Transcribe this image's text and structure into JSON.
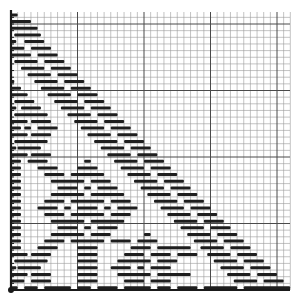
{
  "diagram": {
    "type": "gantt-staircase-on-grid",
    "grid": {
      "origin_px": [
        11,
        290
      ],
      "top_px": 12,
      "right_px": 290,
      "cell_px": 6.65,
      "cols": 42,
      "rows": 42,
      "major_every": 10,
      "minor_color": "#9a9a9a",
      "major_color": "#4a4a4a",
      "axis_color": "#1a1a1a"
    },
    "bar_color": "#1e1e1e",
    "bar_thickness_px": 3,
    "rows": [
      {
        "segments": [
          [
            0,
            1
          ]
        ]
      },
      {
        "segments": [
          [
            0,
            3
          ]
        ]
      },
      {
        "segments": [
          [
            0,
            4
          ]
        ]
      },
      {
        "segments": [
          [
            0.5,
            4.5
          ]
        ]
      },
      {
        "segments": [
          [
            0,
            0.8
          ],
          [
            2,
            5
          ]
        ]
      },
      {
        "segments": [
          [
            0,
            2
          ],
          [
            3,
            6
          ]
        ]
      },
      {
        "segments": [
          [
            0,
            3
          ],
          [
            4,
            7
          ]
        ]
      },
      {
        "segments": [
          [
            0.5,
            4
          ],
          [
            5,
            8
          ]
        ]
      },
      {
        "segments": [
          [
            1.5,
            5
          ],
          [
            6,
            9
          ]
        ]
      },
      {
        "segments": [
          [
            2.5,
            6
          ],
          [
            7,
            10
          ]
        ]
      },
      {
        "segments": [
          [
            0,
            0.5
          ],
          [
            3.5,
            7
          ],
          [
            8,
            11
          ]
        ]
      },
      {
        "segments": [
          [
            0,
            1.5
          ],
          [
            4.5,
            8
          ],
          [
            9,
            12
          ]
        ]
      },
      {
        "segments": [
          [
            0,
            2.5
          ],
          [
            5.5,
            9
          ],
          [
            10,
            13
          ]
        ]
      },
      {
        "segments": [
          [
            0.5,
            3.5
          ],
          [
            6.5,
            10
          ],
          [
            11,
            14
          ]
        ]
      },
      {
        "segments": [
          [
            0,
            0.8
          ],
          [
            1.5,
            4.5
          ],
          [
            7.5,
            11
          ],
          [
            12,
            15
          ]
        ]
      },
      {
        "segments": [
          [
            0.5,
            5.5
          ],
          [
            8.5,
            12
          ],
          [
            13,
            16
          ]
        ]
      },
      {
        "segments": [
          [
            0,
            2.5
          ],
          [
            3,
            6
          ],
          [
            9.5,
            13
          ],
          [
            14,
            17
          ]
        ]
      },
      {
        "segments": [
          [
            0,
            1.5
          ],
          [
            2,
            3
          ],
          [
            4,
            7
          ],
          [
            10.5,
            14
          ],
          [
            15,
            18
          ]
        ]
      },
      {
        "segments": [
          [
            0,
            2.5
          ],
          [
            3,
            6
          ],
          [
            11.5,
            15
          ],
          [
            16,
            19
          ]
        ]
      },
      {
        "segments": [
          [
            0.5,
            5.5
          ],
          [
            12.5,
            16
          ],
          [
            17,
            20
          ]
        ]
      },
      {
        "segments": [
          [
            0,
            0.8
          ],
          [
            1,
            4.5
          ],
          [
            13.5,
            17
          ],
          [
            18,
            21
          ]
        ]
      },
      {
        "segments": [
          [
            0,
            2.5
          ],
          [
            3,
            6
          ],
          [
            14.5,
            18
          ],
          [
            19,
            22
          ]
        ]
      },
      {
        "segments": [
          [
            0,
            1.5
          ],
          [
            2.5,
            5.5
          ],
          [
            11,
            12
          ],
          [
            15.5,
            19
          ],
          [
            20,
            23
          ]
        ]
      },
      {
        "segments": [
          [
            0,
            1.5
          ],
          [
            4,
            7
          ],
          [
            10,
            13
          ],
          [
            16.5,
            20
          ],
          [
            21,
            24
          ]
        ]
      },
      {
        "segments": [
          [
            0,
            1.5
          ],
          [
            5,
            8
          ],
          [
            9,
            14
          ],
          [
            17.5,
            21
          ],
          [
            22,
            25
          ]
        ]
      },
      {
        "segments": [
          [
            0,
            1.5
          ],
          [
            6,
            11
          ],
          [
            12,
            15
          ],
          [
            18.5,
            22
          ],
          [
            23,
            26
          ]
        ]
      },
      {
        "segments": [
          [
            0,
            1.5
          ],
          [
            7,
            10
          ],
          [
            11,
            12
          ],
          [
            13,
            16
          ],
          [
            19.5,
            23
          ],
          [
            24,
            27
          ]
        ]
      },
      {
        "segments": [
          [
            0,
            1.5
          ],
          [
            6,
            11
          ],
          [
            12,
            17
          ],
          [
            20.5,
            24
          ],
          [
            25,
            28
          ]
        ]
      },
      {
        "segments": [
          [
            0,
            1.5
          ],
          [
            5,
            8
          ],
          [
            9,
            14
          ],
          [
            15,
            18
          ],
          [
            21.5,
            25
          ],
          [
            26,
            29
          ]
        ]
      },
      {
        "segments": [
          [
            0,
            1.5
          ],
          [
            4,
            7
          ],
          [
            8,
            9
          ],
          [
            10,
            13
          ],
          [
            14,
            15
          ],
          [
            16,
            19
          ],
          [
            22.5,
            26
          ],
          [
            27,
            30
          ]
        ]
      },
      {
        "segments": [
          [
            0,
            1.5
          ],
          [
            5,
            8
          ],
          [
            9,
            14
          ],
          [
            15,
            18
          ],
          [
            23.5,
            27
          ],
          [
            28,
            31
          ]
        ]
      },
      {
        "segments": [
          [
            0,
            1.5
          ],
          [
            6,
            11
          ],
          [
            12,
            17
          ],
          [
            24.5,
            28
          ],
          [
            29,
            32
          ]
        ]
      },
      {
        "segments": [
          [
            0,
            1.5
          ],
          [
            7,
            10
          ],
          [
            11,
            12
          ],
          [
            13,
            16
          ],
          [
            25.5,
            29
          ],
          [
            30,
            33
          ]
        ]
      },
      {
        "segments": [
          [
            0,
            1.5
          ],
          [
            6,
            11
          ],
          [
            12,
            15
          ],
          [
            20,
            21
          ],
          [
            26.5,
            30
          ],
          [
            31,
            34
          ]
        ]
      },
      {
        "segments": [
          [
            0,
            1.5
          ],
          [
            5,
            8
          ],
          [
            9,
            14
          ],
          [
            15,
            18
          ],
          [
            19,
            22
          ],
          [
            27.5,
            31
          ],
          [
            32,
            35
          ]
        ]
      },
      {
        "segments": [
          [
            0,
            1.5
          ],
          [
            4,
            7
          ],
          [
            10,
            13
          ],
          [
            18,
            21
          ],
          [
            22,
            27
          ],
          [
            28.5,
            32
          ],
          [
            33,
            36
          ]
        ]
      },
      {
        "segments": [
          [
            0,
            2.5
          ],
          [
            3,
            6
          ],
          [
            10,
            13
          ],
          [
            17,
            20
          ],
          [
            21,
            24
          ],
          [
            25,
            28
          ],
          [
            29.5,
            33
          ],
          [
            34,
            37
          ]
        ]
      },
      {
        "segments": [
          [
            0.5,
            5.5
          ],
          [
            10,
            13
          ],
          [
            16,
            21
          ],
          [
            22,
            25
          ],
          [
            30.5,
            34
          ],
          [
            35,
            38
          ]
        ]
      },
      {
        "segments": [
          [
            0,
            0.8
          ],
          [
            1,
            4.5
          ],
          [
            10,
            13
          ],
          [
            15,
            18
          ],
          [
            19,
            20
          ],
          [
            21,
            24
          ],
          [
            31.5,
            35
          ],
          [
            36,
            39
          ]
        ]
      },
      {
        "segments": [
          [
            0,
            2.5
          ],
          [
            3,
            6
          ],
          [
            10,
            13
          ],
          [
            16,
            21
          ],
          [
            22,
            27
          ],
          [
            32.5,
            36
          ],
          [
            37,
            40
          ]
        ]
      },
      {
        "segments": [
          [
            0,
            2
          ],
          [
            3,
            6
          ],
          [
            10,
            13
          ],
          [
            17,
            20
          ],
          [
            21,
            24
          ],
          [
            33.5,
            37
          ],
          [
            38,
            41
          ]
        ]
      },
      {
        "segments": [
          [
            0,
            1
          ],
          [
            2,
            4
          ],
          [
            5,
            9
          ],
          [
            10,
            12
          ],
          [
            13,
            16
          ],
          [
            17,
            21
          ],
          [
            22,
            24
          ],
          [
            25,
            28
          ],
          [
            29,
            34
          ],
          [
            35,
            42
          ]
        ]
      }
    ]
  }
}
